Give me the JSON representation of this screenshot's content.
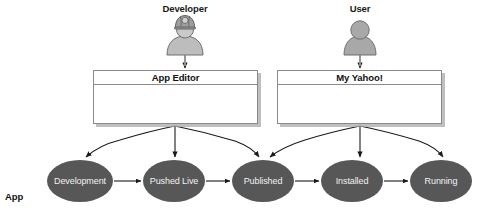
{
  "diagram": {
    "title_hidden": "",
    "colors": {
      "node_fill": "#575757",
      "node_text": "#f2f2f2",
      "box_border": "#8a8a8a",
      "box_fill": "#ffffff",
      "shadow": "#aaaaaa",
      "actor_fill": "#b3b3b3",
      "actor_stroke": "#6e6e6e",
      "arrow": "#1a1a1a",
      "text": "#111111"
    },
    "actors": [
      {
        "id": "developer",
        "label": "Developer",
        "icon": "person-with-hardhat-icon",
        "x": 185,
        "label_y": 3
      },
      {
        "id": "user",
        "label": "User",
        "icon": "person-icon",
        "x": 360,
        "label_y": 3
      }
    ],
    "windows": [
      {
        "id": "app-editor",
        "title": "App Editor",
        "x": 93,
        "y": 70,
        "w": 165,
        "h": 54
      },
      {
        "id": "my-yahoo",
        "title": "My Yahoo!",
        "x": 277,
        "y": 70,
        "w": 165,
        "h": 54
      }
    ],
    "stages_label": "App\nStages:",
    "stages_label_line1": "App",
    "stages_label_line2": "Stages:",
    "stages": [
      {
        "id": "development",
        "label": "Development",
        "cx": 80,
        "cy": 181,
        "rx": 33,
        "ry": 21
      },
      {
        "id": "pushed-live",
        "label": "Pushed Live",
        "cx": 174,
        "cy": 181,
        "rx": 31,
        "ry": 21
      },
      {
        "id": "published",
        "label": "Published",
        "cx": 263,
        "cy": 181,
        "rx": 31,
        "ry": 21
      },
      {
        "id": "installed",
        "label": "Installed",
        "cx": 352,
        "cy": 181,
        "rx": 31,
        "ry": 21
      },
      {
        "id": "running",
        "label": "Running",
        "cx": 441,
        "cy": 181,
        "rx": 31,
        "ry": 21
      }
    ],
    "flow_arrows": [
      {
        "from": "development",
        "to": "pushed-live"
      },
      {
        "from": "pushed-live",
        "to": "published"
      },
      {
        "from": "published",
        "to": "installed"
      },
      {
        "from": "installed",
        "to": "running"
      }
    ],
    "fanout": [
      {
        "source": "app-editor",
        "targets": [
          "development",
          "pushed-live",
          "published"
        ]
      },
      {
        "source": "my-yahoo",
        "targets": [
          "published",
          "installed",
          "running"
        ]
      }
    ]
  }
}
